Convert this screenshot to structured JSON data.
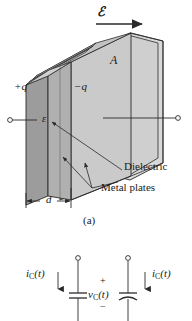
{
  "figure": {
    "caption_a": "(a)",
    "labels": {
      "field": "ℰ",
      "area": "A",
      "charge_positive": "+q",
      "charge_negative": "−q",
      "permittivity": "ε",
      "separation": "d",
      "dielectric": "Dielectric",
      "metal_plates": "Metal plates"
    },
    "colors": {
      "line": "#2a2a2a",
      "front_plate_fill": "#9e9e9e",
      "dielectric_fill": "#c9c9c9",
      "back_plate_fill": "#d6d6d6",
      "top_edge_fill": "#bdbdbd",
      "background": "#ffffff"
    }
  },
  "circuit": {
    "current_left": "i",
    "current_left_sub": "C",
    "current_left_arg": "(t)",
    "current_right": "i",
    "current_right_sub": "C",
    "current_right_arg": "(t)",
    "voltage": "v",
    "voltage_sub": "C",
    "voltage_arg": "(t)",
    "polarity_plus": "+",
    "polarity_minus": "−",
    "current_left_full": "i_C(t)",
    "current_right_full": "i_C(t)",
    "voltage_full": "v_C(t)"
  }
}
